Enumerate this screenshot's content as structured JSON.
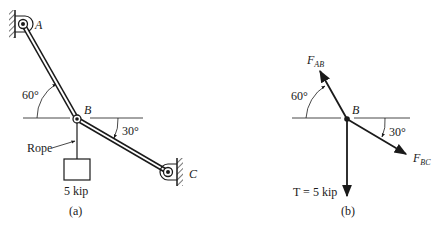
{
  "figure_a": {
    "caption": "(a)",
    "point_A": "A",
    "point_B": "B",
    "point_C": "C",
    "angle_AB": "60°",
    "angle_BC": "30°",
    "rope_label": "Rope",
    "weight_label": "5 kip"
  },
  "figure_b": {
    "caption": "(b)",
    "point_B": "B",
    "force_AB_main": "F",
    "force_AB_sub": "AB",
    "force_BC_main": "F",
    "force_BC_sub": "BC",
    "angle_AB": "60°",
    "angle_BC": "30°",
    "tension_label": "T = 5 kip"
  },
  "colors": {
    "ink": "#1a1a1a",
    "background": "#ffffff"
  }
}
